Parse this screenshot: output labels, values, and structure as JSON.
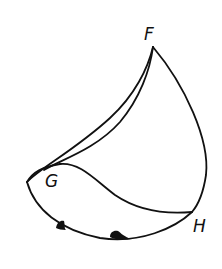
{
  "diagram": {
    "type": "spherical-surface-sketch",
    "stroke_color": "#111111",
    "background_color": "#ffffff",
    "points": {
      "F": {
        "label": "F",
        "x": 153,
        "y": 47
      },
      "G": {
        "label": "G",
        "x": 60,
        "y": 165
      },
      "H": {
        "label": "H",
        "x": 192,
        "y": 212
      },
      "left_cusp": {
        "x": 27,
        "y": 182
      }
    },
    "labels": {
      "F": "F",
      "G": "G",
      "H": "H"
    },
    "edges": [
      {
        "name": "outer-upper-edge",
        "from": "left_cusp",
        "to": "F"
      },
      {
        "name": "inner-upper-edge",
        "from": "G",
        "to": "F"
      },
      {
        "name": "right-edge",
        "from": "F",
        "to": "H"
      },
      {
        "name": "middle-curve",
        "from": "G",
        "to": "H"
      },
      {
        "name": "bottom-curve",
        "from": "left_cusp",
        "to": "H"
      }
    ],
    "markers": [
      {
        "name": "blob-1",
        "x": 62,
        "y": 225
      },
      {
        "name": "blob-2",
        "x": 118,
        "y": 236
      }
    ]
  }
}
